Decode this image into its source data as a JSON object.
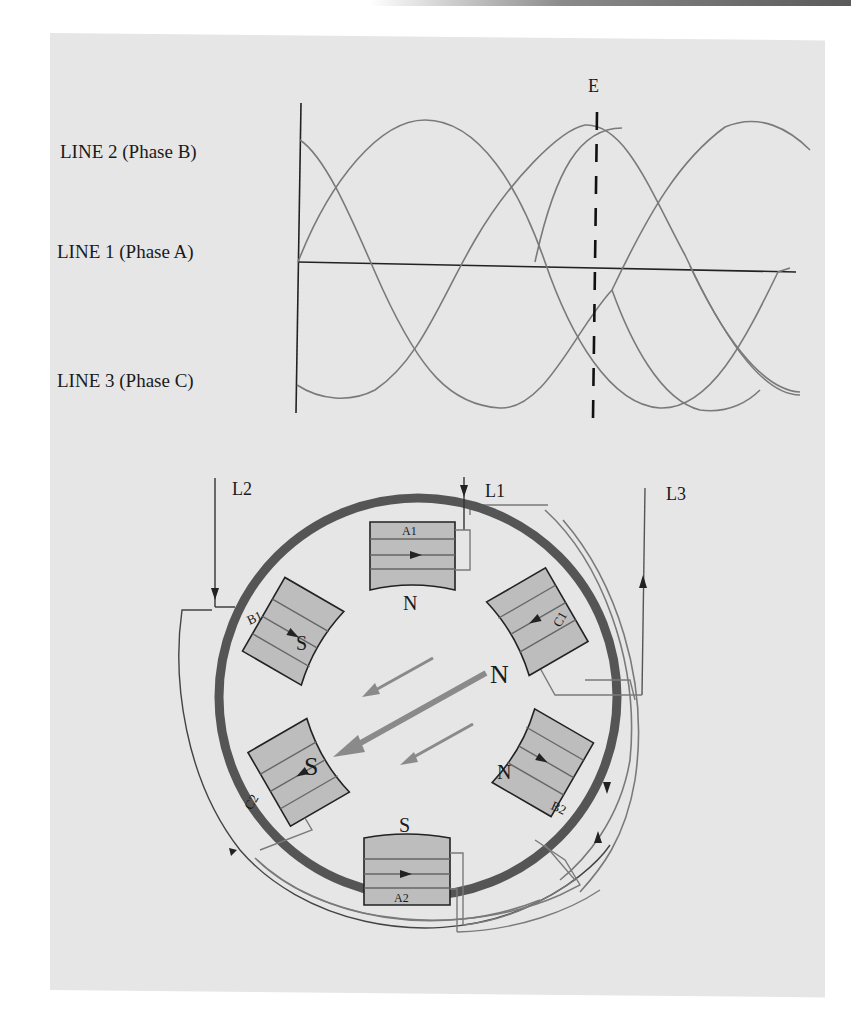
{
  "figure": {
    "waveform": {
      "marker_label": "E",
      "lines": [
        {
          "id": "line2",
          "label": "LINE 2 (Phase B)"
        },
        {
          "id": "line1",
          "label": "LINE 1 (Phase A)"
        },
        {
          "id": "line3",
          "label": "LINE 3 (Phase C)"
        }
      ]
    },
    "motor": {
      "supply_labels": {
        "l1": "L1",
        "l2": "L2",
        "l3": "L3"
      },
      "poles": [
        {
          "id": "A1",
          "label": "A1",
          "polarity": "N"
        },
        {
          "id": "C1",
          "label": "C1",
          "polarity": "N"
        },
        {
          "id": "B2",
          "label": "B2",
          "polarity": "N"
        },
        {
          "id": "A2",
          "label": "A2",
          "polarity": "S"
        },
        {
          "id": "C2",
          "label": "C2",
          "polarity": "S"
        },
        {
          "id": "B1",
          "label": "B1",
          "polarity": "S"
        }
      ],
      "resultant_field": {
        "north": "N",
        "south": "S"
      }
    },
    "colors": {
      "panel": "#e6e6e6",
      "ring": "#555555",
      "pole": "#bdbdbd",
      "wire": "#7a7a7a",
      "arrow": "#8a8a8a",
      "ink": "#1a1a1a"
    }
  }
}
